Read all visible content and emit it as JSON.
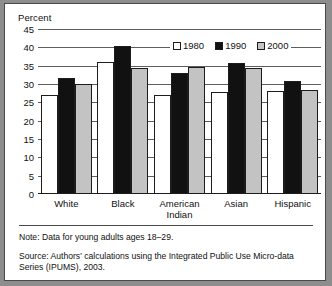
{
  "figure": {
    "axis_title": "Percent",
    "note": "Note: Data for young adults ages 18–29.",
    "source": "Source: Authors' calculations using the Integrated Public Use Micro-data Series (IPUMS), 2003."
  },
  "legend": {
    "items": [
      {
        "label": "1980",
        "color": "#ffffff"
      },
      {
        "label": "1990",
        "color": "#111111"
      },
      {
        "label": "2000",
        "color": "#c3c3c3"
      }
    ]
  },
  "yticks": [
    "45",
    "40",
    "35",
    "30",
    "25",
    "20",
    "15",
    "10",
    "5",
    "0"
  ],
  "xlabels": [
    {
      "line1": "White",
      "line2": ""
    },
    {
      "line1": "Black",
      "line2": ""
    },
    {
      "line1": "American",
      "line2": "Indian"
    },
    {
      "line1": "Asian",
      "line2": ""
    },
    {
      "line1": "Hispanic",
      "line2": ""
    }
  ],
  "chart_data": {
    "type": "bar",
    "title": "",
    "xlabel": "",
    "ylabel": "Percent",
    "ylim": [
      0,
      45
    ],
    "ytick_step": 5,
    "grid": true,
    "legend_position": "top-right",
    "categories": [
      "White",
      "Black",
      "American Indian",
      "Asian",
      "Hispanic"
    ],
    "series": [
      {
        "name": "1980",
        "color": "#ffffff",
        "values": [
          27.0,
          36.0,
          27.0,
          27.7,
          28.0
        ]
      },
      {
        "name": "1990",
        "color": "#111111",
        "values": [
          31.7,
          40.3,
          33.0,
          35.7,
          30.7
        ]
      },
      {
        "name": "2000",
        "color": "#c3c3c3",
        "values": [
          29.9,
          34.3,
          34.7,
          34.4,
          28.5
        ]
      }
    ]
  }
}
